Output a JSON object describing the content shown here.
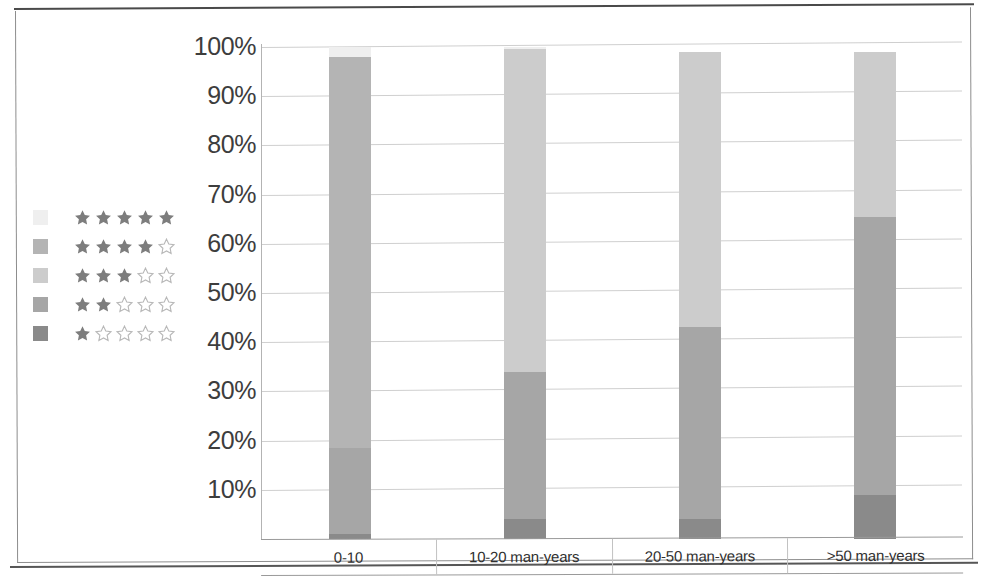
{
  "chart_data": {
    "type": "bar",
    "subtype": "100% stacked column",
    "title": "",
    "subtitle": "",
    "xlabel": "",
    "ylabel": "",
    "categories": [
      "0-10",
      "10-20 man-years",
      "20-50 man-years",
      ">50 man-years"
    ],
    "ylim": [
      0,
      100
    ],
    "ytick_labels": [
      "100%",
      "90%",
      "80%",
      "70%",
      "60%",
      "50%",
      "40%",
      "30%",
      "20%",
      "10%"
    ],
    "ytick_values": [
      100,
      90,
      80,
      70,
      60,
      50,
      40,
      30,
      20,
      10
    ],
    "grid": true,
    "legend_position": "left",
    "value_unit": "%",
    "series": [
      {
        "name": "5 stars",
        "stars_filled": 5,
        "color": "#efefef",
        "values": [
          2.0,
          0.5,
          0.0,
          0.0
        ]
      },
      {
        "name": "4 stars",
        "stars_filled": 4,
        "color": "#b4b4b4",
        "values": [
          79.5,
          0.0,
          0.0,
          0.0
        ]
      },
      {
        "name": "3 stars",
        "stars_filled": 3,
        "color": "#cccccc",
        "values": [
          0.0,
          65.5,
          56.0,
          33.5
        ]
      },
      {
        "name": "2 stars",
        "stars_filled": 2,
        "color": "#a6a6a6",
        "values": [
          17.5,
          30.0,
          39.0,
          56.5
        ]
      },
      {
        "name": "1 star",
        "stars_filled": 1,
        "color": "#8a8a8a",
        "values": [
          1.0,
          4.0,
          4.0,
          9.0
        ]
      }
    ],
    "stack_order_bottom_to_top": [
      "1 star",
      "2 stars",
      "3 stars",
      "4 stars",
      "5 stars"
    ],
    "bars": [
      {
        "category": "0-10",
        "total": 100,
        "segments_bottom_to_top": [
          {
            "series": "1 star",
            "value": 1.0,
            "color": "#8a8a8a"
          },
          {
            "series": "2 stars",
            "value": 17.5,
            "color": "#a6a6a6"
          },
          {
            "series": "4 stars",
            "value": 79.5,
            "color": "#b4b4b4"
          },
          {
            "series": "5 stars",
            "value": 2.0,
            "color": "#efefef"
          }
        ]
      },
      {
        "category": "10-20 man-years",
        "total": 100,
        "segments_bottom_to_top": [
          {
            "series": "1 star",
            "value": 4.0,
            "color": "#8a8a8a"
          },
          {
            "series": "2 stars",
            "value": 30.0,
            "color": "#a6a6a6"
          },
          {
            "series": "3 stars",
            "value": 65.5,
            "color": "#cccccc"
          },
          {
            "series": "5 stars",
            "value": 0.5,
            "color": "#efefef"
          }
        ]
      },
      {
        "category": "20-50 man-years",
        "total": 99,
        "segments_bottom_to_top": [
          {
            "series": "1 star",
            "value": 4.0,
            "color": "#8a8a8a"
          },
          {
            "series": "2 stars",
            "value": 39.0,
            "color": "#a6a6a6"
          },
          {
            "series": "3 stars",
            "value": 56.0,
            "color": "#cccccc"
          }
        ]
      },
      {
        "category": ">50 man-years",
        "total": 99,
        "segments_bottom_to_top": [
          {
            "series": "1 star",
            "value": 9.0,
            "color": "#8a8a8a"
          },
          {
            "series": "2 stars",
            "value": 56.5,
            "color": "#a6a6a6"
          },
          {
            "series": "3 stars",
            "value": 33.5,
            "color": "#cccccc"
          }
        ]
      }
    ]
  },
  "legend": {
    "items": [
      {
        "label": "5 stars",
        "filled": 5,
        "total": 5,
        "color": "#efefef"
      },
      {
        "label": "4 stars",
        "filled": 4,
        "total": 5,
        "color": "#b4b4b4"
      },
      {
        "label": "3 stars",
        "filled": 3,
        "total": 5,
        "color": "#cccccc"
      },
      {
        "label": "2 stars",
        "filled": 2,
        "total": 5,
        "color": "#a6a6a6"
      },
      {
        "label": "1 star",
        "filled": 1,
        "total": 5,
        "color": "#8a8a8a"
      }
    ]
  },
  "axis": {
    "y_ticks": [
      "100%",
      "90%",
      "80%",
      "70%",
      "60%",
      "50%",
      "40%",
      "30%",
      "20%",
      "10%"
    ],
    "x_categories": [
      "0-10",
      "10-20 man-years",
      "20-50 man-years",
      ">50 man-years"
    ]
  },
  "colors": {
    "star_filled": "#7d7d7d",
    "star_empty_stroke": "#b8b8b8",
    "gridline": "#cfcfcf",
    "axis": "#b3b3b3",
    "tick_text": "#3d3d3d",
    "category_text": "#2f2f2f",
    "page_background": "#ffffff",
    "frame": "#4a4a4a"
  }
}
